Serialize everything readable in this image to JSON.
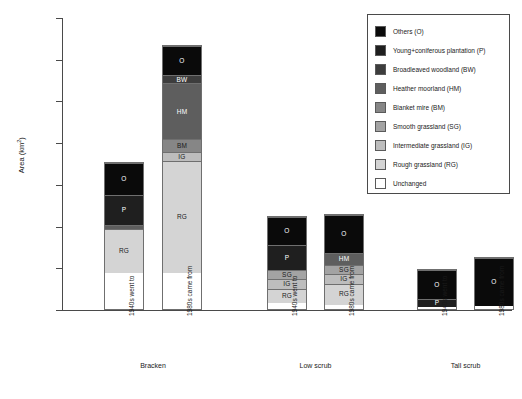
{
  "chart_data": {
    "type": "bar",
    "title": "",
    "subtitle": "",
    "xlabel": "",
    "ylabel": "Area (km2)",
    "ylabel_display": "Area (km",
    "ylabel_sup": "2",
    "ylabel_tail": ")",
    "ylim": [
      0,
      1400
    ],
    "ytick_step": 200,
    "grid": false,
    "stacked": true,
    "legend_position": "top-right-inside-box",
    "yticks": [
      "1,400",
      "1,200",
      "1,000",
      "800",
      "600",
      "400",
      "200",
      "0"
    ],
    "ytick_values": [
      1400,
      1200,
      1000,
      800,
      600,
      400,
      200,
      0
    ],
    "categories": [
      "1940s went to",
      "1980s came from",
      "1940s went to",
      "1980s came from",
      "1940s went to",
      "1980s came from"
    ],
    "groups": [
      {
        "label": "Bracken",
        "bars": [
          0,
          1
        ]
      },
      {
        "label": "Low scrub",
        "bars": [
          2,
          3
        ]
      },
      {
        "label": "Tall scrub",
        "bars": [
          4,
          5
        ]
      }
    ],
    "series": [
      {
        "name": "Unchanged",
        "code": "",
        "color": "#ffffff",
        "values": [
          175,
          175,
          30,
          20,
          12,
          15
        ]
      },
      {
        "name": "Rough grassland",
        "code": "RG",
        "color": "#d4d4d4",
        "values": [
          215,
          540,
          70,
          105,
          0,
          0
        ]
      },
      {
        "name": "Intermediate grassland",
        "code": "IG",
        "color": "#bdbdbd",
        "values": [
          0,
          45,
          45,
          45,
          0,
          0
        ]
      },
      {
        "name": "Smooth grassland",
        "code": "SG",
        "color": "#a3a3a3",
        "values": [
          0,
          0,
          45,
          45,
          0,
          0
        ]
      },
      {
        "name": "Blanket mire",
        "code": "BM",
        "color": "#868686",
        "values": [
          0,
          60,
          0,
          0,
          0,
          0
        ]
      },
      {
        "name": "Heather moorland",
        "code": "HM",
        "color": "#5e5e5e",
        "values": [
          20,
          270,
          0,
          60,
          0,
          0
        ]
      },
      {
        "name": "Broadleaved woodland",
        "code": "BW",
        "color": "#3d3d3d",
        "values": [
          0,
          40,
          0,
          0,
          0,
          0
        ]
      },
      {
        "name": "Young+coniferous plantation",
        "code": "P",
        "color": "#1f1f1f",
        "values": [
          145,
          0,
          125,
          0,
          38,
          0
        ]
      },
      {
        "name": "Others",
        "code": "O",
        "color": "#0a0a0a",
        "values": [
          155,
          140,
          135,
          185,
          148,
          240
        ]
      }
    ],
    "bar_totals": [
      710,
      1270,
      450,
      460,
      198,
      255
    ]
  },
  "legend": {
    "items": [
      {
        "label": "Others (O)",
        "color": "#0a0a0a"
      },
      {
        "label": "Young+coniferous plantation (P)",
        "color": "#1f1f1f"
      },
      {
        "label": "Broadleaved woodland (BW)",
        "color": "#3d3d3d"
      },
      {
        "label": "Heather moorland (HM)",
        "color": "#5e5e5e"
      },
      {
        "label": "Blanket mire (BM)",
        "color": "#868686"
      },
      {
        "label": "Smooth grassland (SG)",
        "color": "#a3a3a3"
      },
      {
        "label": "Intermediate grassland (IG)",
        "color": "#bdbdbd"
      },
      {
        "label": "Rough grassland (RG)",
        "color": "#d4d4d4"
      },
      {
        "label": "Unchanged",
        "color": "#ffffff"
      }
    ]
  }
}
